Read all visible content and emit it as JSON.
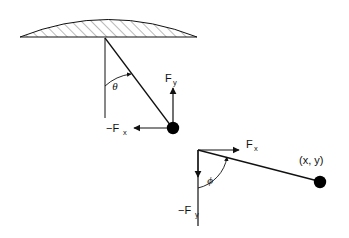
{
  "figure": {
    "background_color": "#ffffff",
    "stroke_color": "#111111",
    "hatch_color": "#666666",
    "bob_fill": "#000000"
  },
  "upper_diagram": {
    "name": "pendulum-attached-to-ceiling",
    "ceiling": {
      "name": "hatched-dome-support",
      "hatch_angle_deg": 45,
      "left_x": 20,
      "right_x": 197,
      "base_y": 37,
      "apex_y": 10
    },
    "pivot": {
      "x": 105,
      "y": 38
    },
    "bob": {
      "x": 173,
      "y": 128,
      "radius": 6
    },
    "vertical_reference": {
      "from_y": 38,
      "to_y": 118
    },
    "angle_label": "θ",
    "angle_label_pos": {
      "x": 115,
      "y": 86
    },
    "force_y": {
      "label": "F",
      "subscript": "y",
      "arrow_from": {
        "x": 173,
        "y": 126
      },
      "arrow_to": {
        "x": 173,
        "y": 88
      },
      "label_pos": {
        "x": 167,
        "y": 80
      }
    },
    "force_x": {
      "label": "−F",
      "subscript": "x",
      "arrow_from": {
        "x": 167,
        "y": 128
      },
      "arrow_to": {
        "x": 133,
        "y": 128
      },
      "label_pos": {
        "x": 108,
        "y": 132
      }
    }
  },
  "lower_diagram": {
    "name": "force-components-at-point",
    "origin": {
      "x": 198,
      "y": 150
    },
    "bob": {
      "x": 320,
      "y": 182,
      "radius": 6
    },
    "angle_label": "ϕ",
    "angle_label_pos": {
      "x": 209,
      "y": 180
    },
    "force_x": {
      "label": "F",
      "subscript": "x",
      "arrow_from": {
        "x": 198,
        "y": 150
      },
      "arrow_to": {
        "x": 241,
        "y": 150
      },
      "label_pos": {
        "x": 247,
        "y": 147
      }
    },
    "force_y": {
      "label": "−F",
      "subscript": "y",
      "arrow_from": {
        "x": 198,
        "y": 150
      },
      "arrow_to": {
        "x": 198,
        "y": 178
      },
      "line_to": {
        "x": 198,
        "y": 226
      },
      "label_pos": {
        "x": 180,
        "y": 212
      }
    },
    "point_label": "(x, y)",
    "point_label_pos": {
      "x": 300,
      "y": 164
    }
  }
}
